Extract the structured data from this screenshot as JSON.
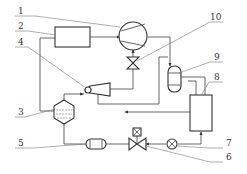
{
  "diagram": {
    "type": "refrigeration-ejector-cycle-schematic",
    "labels": [
      {
        "id": "1",
        "text": "1"
      },
      {
        "id": "2",
        "text": "2"
      },
      {
        "id": "3",
        "text": "3"
      },
      {
        "id": "4",
        "text": "4"
      },
      {
        "id": "5",
        "text": "5"
      },
      {
        "id": "6",
        "text": "6"
      },
      {
        "id": "7",
        "text": "7"
      },
      {
        "id": "8",
        "text": "8"
      },
      {
        "id": "9",
        "text": "9"
      },
      {
        "id": "10",
        "text": "10"
      }
    ],
    "components": [
      {
        "label": "1",
        "shape": "compressor-circle"
      },
      {
        "label": "2",
        "shape": "rectangle"
      },
      {
        "label": "3",
        "shape": "hexagon-separator-with-liquid"
      },
      {
        "label": "4",
        "shape": "ejector"
      },
      {
        "label": "5",
        "shape": "capsule-filter"
      },
      {
        "label": "6",
        "shape": "solenoid-valve"
      },
      {
        "label": "7",
        "shape": "circle-x-sight-glass"
      },
      {
        "label": "8",
        "shape": "rectangle-tall"
      },
      {
        "label": "9",
        "shape": "capsule-vertical-receiver"
      },
      {
        "label": "10",
        "shape": "expansion-valve"
      }
    ],
    "colors": {
      "line": "#555555",
      "component": "#333333",
      "background": "#ffffff"
    }
  }
}
